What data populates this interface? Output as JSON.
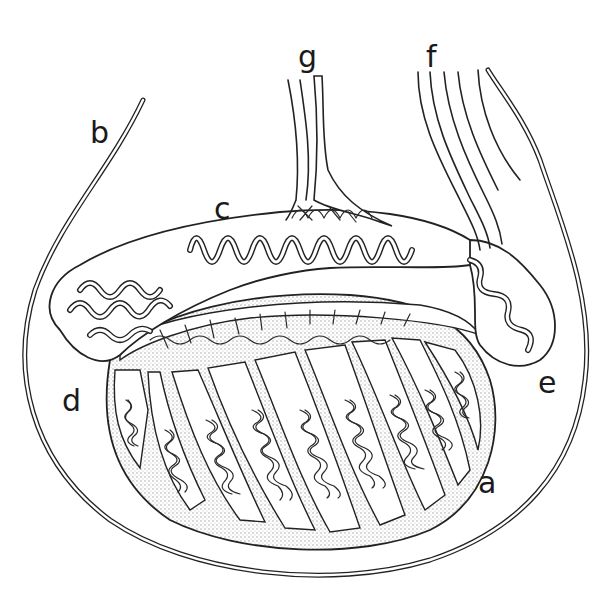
{
  "figure": {
    "labels": [
      {
        "id": "a",
        "text": "a",
        "x": 478,
        "y": 468
      },
      {
        "id": "b",
        "text": "b",
        "x": 90,
        "y": 118
      },
      {
        "id": "c",
        "text": "c",
        "x": 214,
        "y": 194
      },
      {
        "id": "d",
        "text": "d",
        "x": 62,
        "y": 386
      },
      {
        "id": "e",
        "text": "e",
        "x": 538,
        "y": 368
      },
      {
        "id": "f",
        "text": "f",
        "x": 426,
        "y": 42
      },
      {
        "id": "g",
        "text": "g",
        "x": 298,
        "y": 42
      }
    ],
    "colors": {
      "ink": "#222222",
      "background": "#ffffff",
      "stipple": "#bdbdbd"
    }
  }
}
